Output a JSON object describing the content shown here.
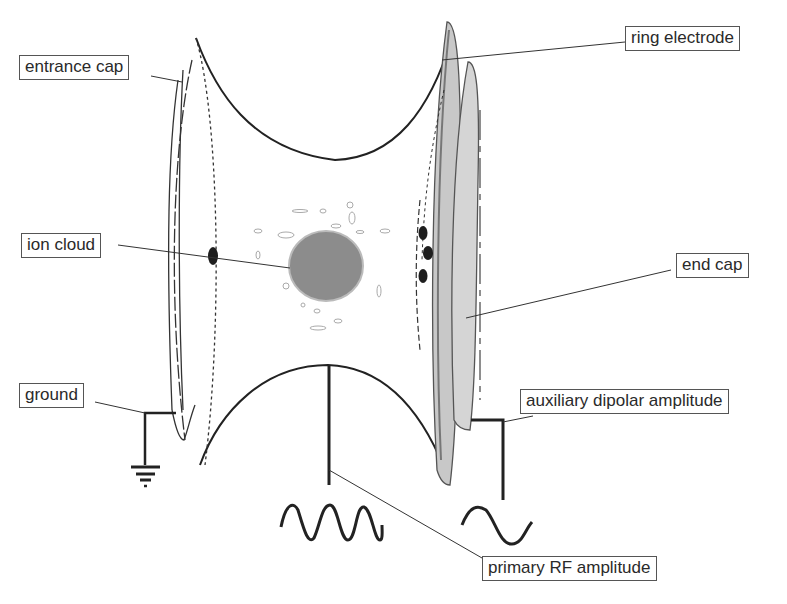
{
  "diagram": {
    "labels": {
      "entrance_cap": "entrance cap",
      "ring_electrode": "ring electrode",
      "ion_cloud": "ion cloud",
      "end_cap": "end cap",
      "ground": "ground",
      "auxiliary_dipolar_amplitude": "auxiliary dipolar amplitude",
      "primary_rf_amplitude": "primary RF amplitude"
    },
    "components": [
      {
        "id": "entrance-cap",
        "type": "electrode",
        "position": "left"
      },
      {
        "id": "ring-electrode",
        "type": "electrode",
        "position": "top/bottom hyperbolic"
      },
      {
        "id": "end-cap",
        "type": "electrode",
        "position": "right"
      },
      {
        "id": "ion-cloud",
        "type": "ion-cluster",
        "position": "center"
      },
      {
        "id": "ground-symbol",
        "type": "ground",
        "connected_to": "entrance-cap"
      },
      {
        "id": "rf-waveform",
        "type": "sine-waveform",
        "cycles": 3,
        "connected_to": "ring-electrode"
      },
      {
        "id": "dipolar-waveform",
        "type": "sine-waveform",
        "cycles": 1,
        "connected_to": "end-cap"
      }
    ],
    "colors": {
      "line": "#222222",
      "electrode_gray": "#9a9a9a",
      "ion_cloud_fill": "#8c8c8c",
      "ion_dark": "#1e1e1e",
      "label_border": "#555555",
      "background": "#ffffff"
    }
  }
}
